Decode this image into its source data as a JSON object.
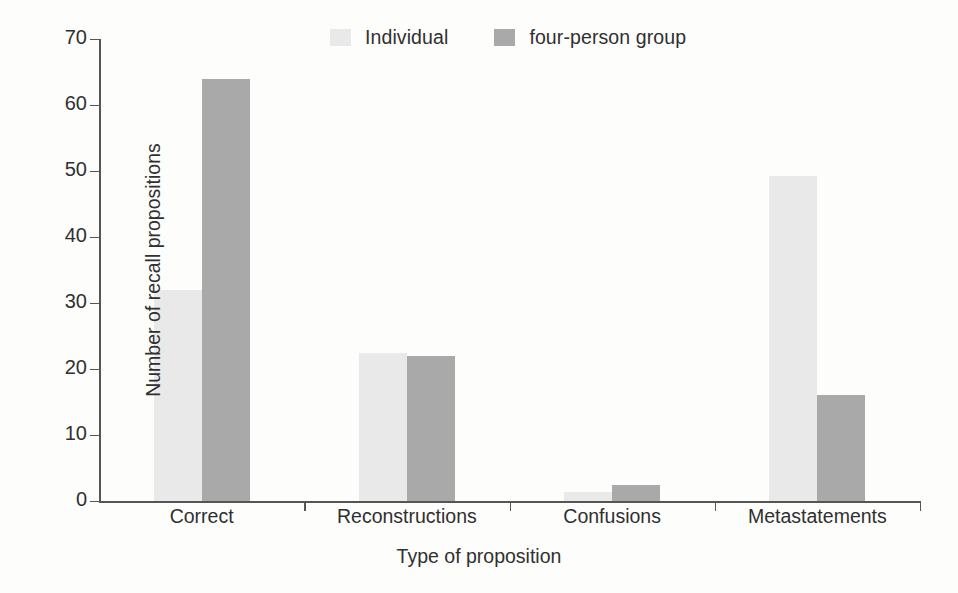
{
  "chart_data": {
    "type": "bar",
    "title": "",
    "subtitle": "",
    "xlabel": "Type of proposition",
    "ylabel": "Number of recall propositions",
    "categories": [
      "Correct",
      "Reconstructions",
      "Confusions",
      "Metastatements"
    ],
    "series": [
      {
        "name": "Individual",
        "color": "#e9e9e9",
        "values": [
          32,
          22.5,
          1.4,
          49.3
        ]
      },
      {
        "name": "four-person group",
        "color": "#a9a9a9",
        "values": [
          64,
          22,
          2.5,
          16
        ]
      }
    ],
    "ylim": [
      0,
      70
    ],
    "yticks": [
      0,
      10,
      20,
      30,
      40,
      50,
      60,
      70
    ],
    "ytick_labels": [
      "0",
      "10",
      "20",
      "30",
      "40",
      "50",
      "60",
      "70"
    ],
    "grid": false,
    "legend_position": "top-center",
    "axis_color": "#555555"
  },
  "legend": {
    "items": [
      {
        "label": "Individual",
        "swatch": "#e9e9e9"
      },
      {
        "label": "four-person group",
        "swatch": "#a9a9a9"
      }
    ]
  }
}
